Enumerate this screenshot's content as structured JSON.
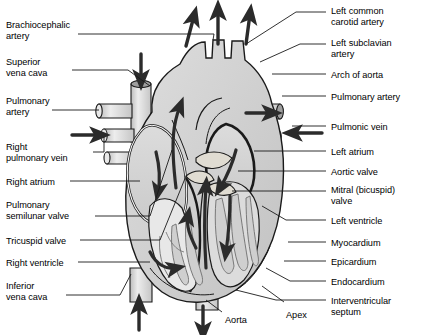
{
  "diagram": {
    "style": "grayscale line drawing with blood-flow arrows",
    "colors": {
      "outline": "#1a1a1a",
      "heart_fill": "#cfcfcf",
      "chamber_fill": "#d9d9d9",
      "vessel_fill": "#e2e2e2",
      "wall_fill": "#f2f2f2",
      "arrow": "#2b2b2b",
      "background": "#ffffff",
      "text": "#000000"
    },
    "labels_left": [
      {
        "id": "brachiocephalic-artery",
        "text": "Brachiocephalic\nartery",
        "x": 6,
        "y": 20
      },
      {
        "id": "superior-vena-cava",
        "text": "Superior\nvena cava",
        "x": 6,
        "y": 57
      },
      {
        "id": "pulmonary-artery-left",
        "text": "Pulmonary\nartery",
        "x": 6,
        "y": 96
      },
      {
        "id": "right-pulmonary-vein",
        "text": "Right\npulmonary vein",
        "x": 6,
        "y": 142
      },
      {
        "id": "right-atrium",
        "text": "Right atrium",
        "x": 6,
        "y": 177
      },
      {
        "id": "pulmonary-semilunar-valve",
        "text": "Pulmonary\nsemilunar valve",
        "x": 6,
        "y": 200
      },
      {
        "id": "tricuspid-valve",
        "text": "Tricuspid valve",
        "x": 6,
        "y": 236
      },
      {
        "id": "right-ventricle",
        "text": "Right ventricle",
        "x": 6,
        "y": 258
      },
      {
        "id": "inferior-vena-cava",
        "text": "Inferior\nvena cava",
        "x": 6,
        "y": 281
      }
    ],
    "labels_right": [
      {
        "id": "left-common-carotid-artery",
        "text": "Left common\ncarotid artery",
        "x": 331,
        "y": 6
      },
      {
        "id": "left-subclavian-artery",
        "text": "Left subclavian\nartery",
        "x": 331,
        "y": 38
      },
      {
        "id": "arch-of-aorta",
        "text": "Arch of aorta",
        "x": 331,
        "y": 70
      },
      {
        "id": "pulmonary-artery-right",
        "text": "Pulmonary artery",
        "x": 331,
        "y": 92
      },
      {
        "id": "pulmonic-vein",
        "text": "Pulmonic vein",
        "x": 331,
        "y": 122
      },
      {
        "id": "left-atrium",
        "text": "Left atrium",
        "x": 331,
        "y": 147
      },
      {
        "id": "aortic-valve",
        "text": "Aortic valve",
        "x": 331,
        "y": 167
      },
      {
        "id": "mitral-bicuspid-valve",
        "text": "Mitral (bicuspid)\nvalve",
        "x": 331,
        "y": 185
      },
      {
        "id": "left-ventricle",
        "text": "Left ventricle",
        "x": 331,
        "y": 216
      },
      {
        "id": "myocardium",
        "text": "Myocardium",
        "x": 331,
        "y": 238
      },
      {
        "id": "epicardium",
        "text": "Epicardium",
        "x": 331,
        "y": 257
      },
      {
        "id": "endocardium",
        "text": "Endocardium",
        "x": 331,
        "y": 277
      },
      {
        "id": "interventricular-septum",
        "text": "Interventricular\nseptum",
        "x": 331,
        "y": 296
      }
    ],
    "labels_inline": [
      {
        "id": "apex",
        "text": "Apex",
        "x": 286,
        "y": 310
      },
      {
        "id": "aorta",
        "text": "Aorta",
        "x": 225,
        "y": 315
      }
    ],
    "flow_arrows": [
      {
        "id": "arrow-up-brachiocephalic",
        "direction": "up",
        "x": 191,
        "y": 30
      },
      {
        "id": "arrow-up-carotid",
        "direction": "up",
        "x": 218,
        "y": 22
      },
      {
        "id": "arrow-up-subclavian",
        "direction": "up",
        "x": 248,
        "y": 28
      },
      {
        "id": "arrow-down-superior-vena-cava",
        "direction": "down",
        "x": 141,
        "y": 70
      },
      {
        "id": "arrow-in-right-pulmonary-vein",
        "direction": "right",
        "x": 86,
        "y": 135
      },
      {
        "id": "arrow-in-pulmonic-vein",
        "direction": "left",
        "x": 305,
        "y": 133
      },
      {
        "id": "arrow-out-pulmonary-artery",
        "direction": "right",
        "x": 258,
        "y": 113
      },
      {
        "id": "arrow-up-inferior-vena-cava",
        "direction": "up",
        "x": 139,
        "y": 310
      },
      {
        "id": "arrow-down-aorta",
        "direction": "down",
        "x": 203,
        "y": 312
      }
    ],
    "internal_flow_arrows": [
      {
        "id": "arrow-right-atrium-flow",
        "chamber": "right atrium"
      },
      {
        "id": "arrow-tricuspid-flow",
        "chamber": "right ventricle"
      },
      {
        "id": "arrow-right-ventricle-outflow",
        "chamber": "pulmonary trunk"
      },
      {
        "id": "arrow-left-atrium-flow",
        "chamber": "left atrium"
      },
      {
        "id": "arrow-mitral-flow",
        "chamber": "left ventricle"
      },
      {
        "id": "arrow-left-ventricle-outflow",
        "chamber": "aorta"
      }
    ]
  }
}
